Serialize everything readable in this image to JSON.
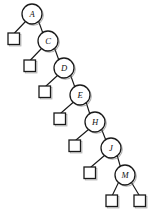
{
  "figure": {
    "type": "binary-search-tree-diagram",
    "title": "",
    "width": 152,
    "height": 220,
    "background_color": "#ffffff",
    "stroke_color": "#1a1a1a",
    "shadow_color": "#6b6b6b",
    "node_fill": "#ffffff"
  },
  "chart_data": {
    "type": "diagram",
    "shape": "right-leaning degenerate binary search tree",
    "node_labels": [
      "A",
      "C",
      "D",
      "E",
      "H",
      "J",
      "M"
    ],
    "leaf_count": 8,
    "edges": [
      [
        "A",
        "leaf-1"
      ],
      [
        "A",
        "C"
      ],
      [
        "C",
        "leaf-2"
      ],
      [
        "C",
        "D"
      ],
      [
        "D",
        "leaf-3"
      ],
      [
        "D",
        "E"
      ],
      [
        "E",
        "leaf-4"
      ],
      [
        "E",
        "H"
      ],
      [
        "H",
        "leaf-5"
      ],
      [
        "H",
        "J"
      ],
      [
        "J",
        "leaf-6"
      ],
      [
        "J",
        "M"
      ],
      [
        "M",
        "leaf-7"
      ],
      [
        "M",
        "leaf-8"
      ]
    ]
  },
  "nodes": [
    {
      "id": "A",
      "label": "A",
      "cx": 32,
      "cy": 14,
      "r": 10.0
    },
    {
      "id": "C",
      "label": "C",
      "cx": 48,
      "cy": 41,
      "r": 10.0
    },
    {
      "id": "D",
      "label": "D",
      "cx": 64,
      "cy": 68,
      "r": 10.0
    },
    {
      "id": "E",
      "label": "E",
      "cx": 80,
      "cy": 95,
      "r": 10.0
    },
    {
      "id": "H",
      "label": "H",
      "cx": 95,
      "cy": 122,
      "r": 10.0
    },
    {
      "id": "J",
      "label": "J",
      "cx": 111,
      "cy": 148,
      "r": 10.0
    },
    {
      "id": "M",
      "label": "M",
      "cx": 125,
      "cy": 175,
      "r": 10.0
    }
  ],
  "leaves": [
    {
      "id": "leaf-1",
      "x": 8,
      "y": 33,
      "size": 11.5
    },
    {
      "id": "leaf-2",
      "x": 24,
      "y": 60,
      "size": 11.5
    },
    {
      "id": "leaf-3",
      "x": 39,
      "y": 86,
      "size": 11.5
    },
    {
      "id": "leaf-4",
      "x": 54,
      "y": 113,
      "size": 11.5
    },
    {
      "id": "leaf-5",
      "x": 69,
      "y": 140,
      "size": 11.5
    },
    {
      "id": "leaf-6",
      "x": 84,
      "y": 167,
      "size": 11.5
    },
    {
      "id": "leaf-7",
      "x": 106,
      "y": 195,
      "size": 11.5
    },
    {
      "id": "leaf-8",
      "x": 134,
      "y": 195,
      "size": 11.5
    }
  ],
  "edges": [
    {
      "id": "edge-A-leaf1",
      "x1": 25.5,
      "y1": 21.5,
      "x2": 14.5,
      "y2": 33.0
    },
    {
      "id": "edge-A-C",
      "x1": 38.5,
      "y1": 21.0,
      "x2": 43.0,
      "y2": 33.5
    },
    {
      "id": "edge-C-leaf2",
      "x1": 41.5,
      "y1": 48.5,
      "x2": 30.5,
      "y2": 60.0
    },
    {
      "id": "edge-C-D",
      "x1": 54.5,
      "y1": 48.0,
      "x2": 59.0,
      "y2": 60.5
    },
    {
      "id": "edge-D-leaf3",
      "x1": 57.5,
      "y1": 75.5,
      "x2": 46.0,
      "y2": 86.0
    },
    {
      "id": "edge-D-E",
      "x1": 70.5,
      "y1": 75.0,
      "x2": 75.0,
      "y2": 87.5
    },
    {
      "id": "edge-E-leaf4",
      "x1": 73.0,
      "y1": 102.5,
      "x2": 61.0,
      "y2": 113.0
    },
    {
      "id": "edge-E-H",
      "x1": 86.0,
      "y1": 102.0,
      "x2": 90.0,
      "y2": 114.5
    },
    {
      "id": "edge-H-leaf5",
      "x1": 88.5,
      "y1": 129.5,
      "x2": 76.0,
      "y2": 140.0
    },
    {
      "id": "edge-H-J",
      "x1": 101.5,
      "y1": 129.0,
      "x2": 106.0,
      "y2": 140.5
    },
    {
      "id": "edge-J-leaf6",
      "x1": 104.5,
      "y1": 155.5,
      "x2": 91.0,
      "y2": 167.0
    },
    {
      "id": "edge-J-M",
      "x1": 117.0,
      "y1": 155.0,
      "x2": 120.5,
      "y2": 167.0
    },
    {
      "id": "edge-M-leaf7",
      "x1": 118.5,
      "y1": 182.5,
      "x2": 112.5,
      "y2": 195.0
    },
    {
      "id": "edge-M-leaf8",
      "x1": 131.5,
      "y1": 182.5,
      "x2": 139.0,
      "y2": 195.0
    }
  ]
}
